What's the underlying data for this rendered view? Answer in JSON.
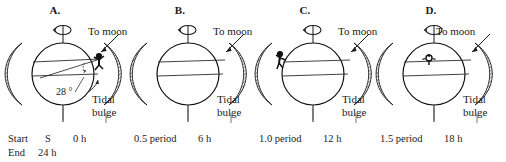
{
  "figure": {
    "panels": [
      {
        "letter": "A.",
        "to_moon_label": "To moon",
        "tidal_bulge_label_line1": "Tidal",
        "tidal_bulge_label_line2": "bulge",
        "angle_label": "28 °",
        "observer_position": "right-limb",
        "bottom_left_label": "Start",
        "bottom_pole_label": "S",
        "bottom_time_label": "0 h",
        "bottom_second_row_left": "End",
        "bottom_second_row_time": "24 h"
      },
      {
        "letter": "B.",
        "to_moon_label": "To moon",
        "tidal_bulge_label_line1": "Tidal",
        "tidal_bulge_label_line2": "bulge",
        "observer_position": "none",
        "bottom_period_label": "0.5 period",
        "bottom_time_label": "6 h"
      },
      {
        "letter": "C.",
        "to_moon_label": "To moon",
        "tidal_bulge_label_line1": "Tidal",
        "tidal_bulge_label_line2": "bulge",
        "observer_position": "left-limb",
        "bottom_period_label": "1.0 period",
        "bottom_time_label": "12 h"
      },
      {
        "letter": "D.",
        "to_moon_label": "To moon",
        "tidal_bulge_label_line1": "Tidal",
        "tidal_bulge_label_line2": "bulge",
        "observer_position": "center-facing-away",
        "bottom_period_label": "1.5 period",
        "bottom_time_label": "18 h"
      }
    ],
    "icons": {
      "rotation_arrow": "rotation-arrow-icon",
      "moon_direction_arrow": "arrow-icon",
      "bulge_pointer": "pointer-icon",
      "observer": "person-icon"
    },
    "colors": {
      "ink": "#1a1a1a",
      "globe_outline": "#111111",
      "hatch": "#3a3a3a",
      "background": "#ffffff",
      "latitude_line": "#2b2b2b"
    }
  }
}
